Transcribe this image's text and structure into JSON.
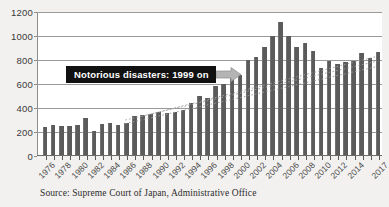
{
  "chart_data": {
    "type": "bar",
    "title": "",
    "subtitle": "",
    "xlabel": "",
    "ylabel": "",
    "ylim": [
      0,
      1200
    ],
    "ytick_values": [
      0,
      200,
      400,
      600,
      800,
      1000,
      1200
    ],
    "ytick_labels": [
      "0",
      "200",
      "400",
      "600",
      "800",
      "1000",
      "1200"
    ],
    "grid": true,
    "legend": null,
    "legend_position": "none",
    "bar_color": "#5b5b5b",
    "categories": [
      "1976",
      "1977",
      "1978",
      "1979",
      "1980",
      "1981",
      "1982",
      "1983",
      "1984",
      "1985",
      "1986",
      "1987",
      "1988",
      "1989",
      "1990",
      "1991",
      "1992",
      "1993",
      "1994",
      "1995",
      "1996",
      "1997",
      "1998",
      "1999",
      "2000",
      "2001",
      "2002",
      "2003",
      "2004",
      "2005",
      "2006",
      "2007",
      "2008",
      "2009",
      "2010",
      "2011",
      "2012",
      "2013",
      "2014",
      "2015",
      "2016",
      "2017"
    ],
    "values": [
      232,
      251,
      238,
      244,
      249,
      308,
      198,
      258,
      268,
      250,
      268,
      327,
      330,
      345,
      358,
      353,
      355,
      372,
      437,
      492,
      477,
      571,
      594,
      645,
      670,
      793,
      815,
      900,
      993,
      1105,
      993,
      903,
      932,
      868,
      722,
      783,
      758,
      777,
      786,
      849,
      812,
      862
    ],
    "xtick_labels": [
      "1976",
      "1978",
      "1980",
      "1982",
      "1984",
      "1986",
      "1988",
      "1990",
      "1992",
      "1994",
      "1996",
      "1998",
      "2000",
      "2002",
      "2004",
      "2006",
      "2008",
      "2010",
      "2012",
      "2014",
      "2017"
    ],
    "xtick_indices": [
      0,
      2,
      4,
      6,
      8,
      10,
      12,
      14,
      16,
      18,
      20,
      22,
      24,
      26,
      28,
      30,
      32,
      34,
      36,
      38,
      41
    ],
    "annotations": [
      {
        "text": "Notorious disasters: 1999 on",
        "style": "black-box-white-text-with-arrow",
        "points_to": "1999"
      }
    ],
    "trend_lines": {
      "style": "dotted",
      "color": "#9c9c9c",
      "count": 3,
      "description": "three faint dotted upward trend lines crossing the bars from the mid-1980s to 2017"
    }
  },
  "annotation": {
    "callout_text": "Notorious disasters: 1999 on",
    "arrow_icon": "right-arrow-icon",
    "box_color": "#111111",
    "text_color": "#ffffff",
    "arrow_color": "#b0b0b0"
  },
  "caption": {
    "source_text": "Source: Supreme Court of Japan, Administrative Office"
  },
  "colors": {
    "bar": "#5b5b5b",
    "gridline": "#9a9a9a",
    "plot_background": "#ffffff",
    "figure_background": "#f2f1ef",
    "axis": "#6a6a6a",
    "tick_label": "#3a3a3a"
  }
}
